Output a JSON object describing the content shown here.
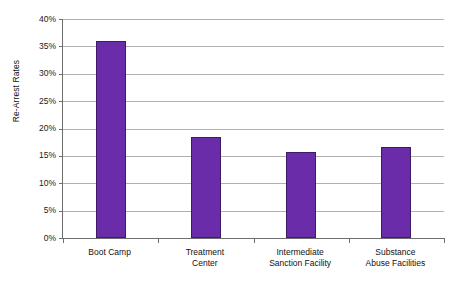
{
  "chart_data": {
    "type": "bar",
    "title": "",
    "xlabel": "",
    "ylabel": "Re-Arrest Rates",
    "ylim": [
      0,
      40
    ],
    "ytick_step": 5,
    "grid": true,
    "legend": "none",
    "bar_color": "#6A2CA8",
    "bar_border_color": "#3F1A66",
    "gridline_color": "#B0B0B5",
    "axis_color": "#6E6E6E",
    "background_color": "#FFFFFF",
    "categories": [
      "Boot Camp",
      "Treatment Center",
      "Intermediate Sanction Facility",
      "Substance Abuse Facilities"
    ],
    "category_label_lines": [
      [
        "Boot Camp"
      ],
      [
        "Treatment",
        "Center"
      ],
      [
        "Intermediate",
        "Sanction Facility"
      ],
      [
        "Substance",
        "Abuse Facilities"
      ]
    ],
    "values": [
      36.0,
      18.4,
      15.7,
      16.6
    ],
    "value_unit": "%",
    "ytick_labels": [
      "40%",
      "35%",
      "30%",
      "25%",
      "20%",
      "15%",
      "10%",
      "5%",
      "0%"
    ],
    "ytick_values": [
      40,
      35,
      30,
      25,
      20,
      15,
      10,
      5,
      0
    ]
  }
}
